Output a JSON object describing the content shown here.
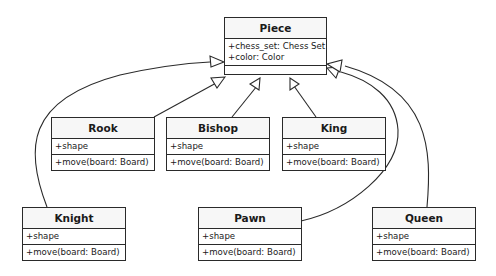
{
  "diagram": {
    "type": "uml-class-diagram",
    "relationship": "inheritance",
    "parent": {
      "name": "Piece",
      "attributes": [
        "+chess_set: Chess Set",
        "+color: Color"
      ],
      "methods": []
    },
    "children": [
      {
        "name": "Rook",
        "attributes": [
          "+shape"
        ],
        "methods": [
          "+move(board: Board)"
        ]
      },
      {
        "name": "Bishop",
        "attributes": [
          "+shape"
        ],
        "methods": [
          "+move(board: Board)"
        ]
      },
      {
        "name": "King",
        "attributes": [
          "+shape"
        ],
        "methods": [
          "+move(board: Board)"
        ]
      },
      {
        "name": "Knight",
        "attributes": [
          "+shape"
        ],
        "methods": [
          "+move(board: Board)"
        ]
      },
      {
        "name": "Pawn",
        "attributes": [
          "+shape"
        ],
        "methods": [
          "+move(board: Board)"
        ]
      },
      {
        "name": "Queen",
        "attributes": [
          "+shape"
        ],
        "methods": [
          "+move(board: Board)"
        ]
      }
    ]
  },
  "colors": {
    "stroke": "#2a2a2a",
    "header_bg": "#f7f7f7",
    "background": "#ffffff"
  }
}
